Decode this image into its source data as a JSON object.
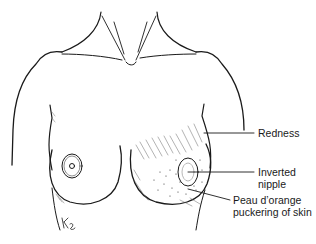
{
  "diagram": {
    "labels": [
      {
        "id": "redness",
        "lines": [
          "Redness"
        ]
      },
      {
        "id": "inverted-nipple",
        "lines": [
          "Inverted",
          "nipple"
        ]
      },
      {
        "id": "peau-dorange",
        "lines": [
          "Peau d’orange",
          "puckering of skin"
        ]
      }
    ],
    "signature": "Kg"
  },
  "colors": {
    "stroke": "#1a1a1a",
    "hatch": "#555555",
    "background": "#ffffff"
  }
}
